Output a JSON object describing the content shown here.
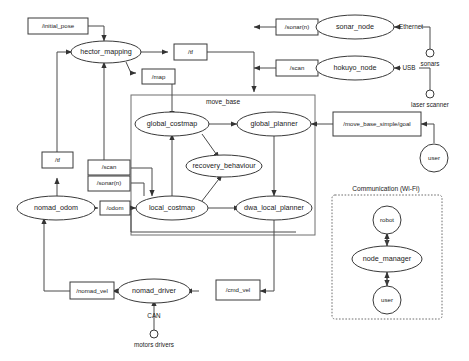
{
  "diagram": {
    "colors": {
      "stroke": "#3a3a3a",
      "edge": "#4a4a4a",
      "group": "#6f6f6f",
      "fill": "#ffffff",
      "text": "#1a1a1a"
    },
    "groups": [
      {
        "id": "move_base",
        "label": "move_base",
        "style": "solid"
      },
      {
        "id": "communication",
        "label": "Communication (Wi-Fi)",
        "style": "dashed"
      }
    ],
    "nodes": [
      {
        "id": "hector_mapping",
        "label": "hector_mapping",
        "shape": "ellipse"
      },
      {
        "id": "sonar_node",
        "label": "sonar_node",
        "shape": "ellipse"
      },
      {
        "id": "hokuyo_node",
        "label": "hokuyo_node",
        "shape": "ellipse"
      },
      {
        "id": "global_costmap",
        "label": "global_costmap",
        "shape": "ellipse"
      },
      {
        "id": "global_planner",
        "label": "global_planner",
        "shape": "ellipse"
      },
      {
        "id": "recovery_behaviour",
        "label": "recovery_behaviour",
        "shape": "ellipse"
      },
      {
        "id": "local_costmap",
        "label": "local_costmap",
        "shape": "ellipse"
      },
      {
        "id": "dwa_local_planner",
        "label": "dwa_local_planner",
        "shape": "ellipse"
      },
      {
        "id": "nomad_odom",
        "label": "nomad_odom",
        "shape": "ellipse"
      },
      {
        "id": "nomad_driver",
        "label": "nomad_driver",
        "shape": "ellipse"
      },
      {
        "id": "node_manager",
        "label": "node_manager",
        "shape": "ellipse"
      }
    ],
    "topics": [
      {
        "id": "initial_pose",
        "label": "/initial_pose"
      },
      {
        "id": "tf_top",
        "label": "/tf"
      },
      {
        "id": "map",
        "label": "/map"
      },
      {
        "id": "sonar_n_top",
        "label": "/sonar(n)"
      },
      {
        "id": "scan_top",
        "label": "/scan"
      },
      {
        "id": "move_base_simple_goal",
        "label": "/move_base_simple/goal"
      },
      {
        "id": "tf_left",
        "label": "/tf"
      },
      {
        "id": "scan_left",
        "label": "/scan"
      },
      {
        "id": "sonar_n_left",
        "label": "/sonar(n)"
      },
      {
        "id": "odom",
        "label": "/odom"
      },
      {
        "id": "nomad_vel",
        "label": "/nomad_vel"
      },
      {
        "id": "cmd_vel",
        "label": "/cmd_vel"
      }
    ],
    "actors": [
      {
        "id": "user_goal",
        "label": "user"
      },
      {
        "id": "robot_wifi",
        "label": "robot"
      },
      {
        "id": "user_wifi",
        "label": "user"
      }
    ],
    "hardware": [
      {
        "id": "sonars",
        "label": "sonars",
        "bus": "Ethernet"
      },
      {
        "id": "laser_scanner",
        "label": "laser scanner",
        "bus": "USB"
      },
      {
        "id": "motors_drivers",
        "label": "motors drivers",
        "bus": "CAN"
      }
    ],
    "bus_labels": {
      "ethernet": "Ethernet",
      "usb": "USB",
      "can": "CAN"
    }
  }
}
